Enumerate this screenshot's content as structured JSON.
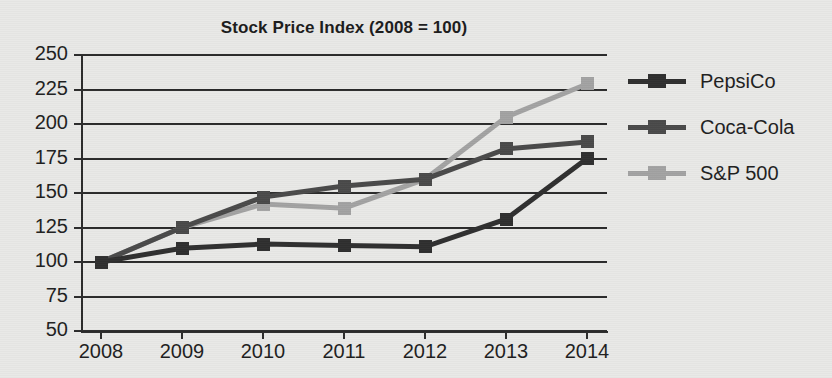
{
  "chart_data": {
    "type": "line",
    "title": "Stock Price Index (2008 = 100)",
    "xlabel": "",
    "ylabel": "",
    "categories": [
      "2008",
      "2009",
      "2010",
      "2011",
      "2012",
      "2013",
      "2014"
    ],
    "ylim": [
      50,
      250
    ],
    "ytick_step": 25,
    "yticks": [
      "250",
      "225",
      "200",
      "175",
      "150",
      "125",
      "100",
      "75",
      "50"
    ],
    "grid": "horizontal",
    "legend_position": "right",
    "series": [
      {
        "name": "PepsiCo",
        "color": "#2f2f2f",
        "values": [
          100,
          110,
          113,
          112,
          111,
          131,
          175
        ]
      },
      {
        "name": "Coca-Cola",
        "color": "#4a4a4a",
        "values": [
          100,
          125,
          147,
          155,
          160,
          182,
          187
        ]
      },
      {
        "name": "S&P 500",
        "color": "#a3a3a3",
        "values": [
          100,
          125,
          142,
          139,
          160,
          205,
          229
        ]
      }
    ]
  },
  "legend": {
    "items": [
      {
        "label": "PepsiCo"
      },
      {
        "label": "Coca-Cola"
      },
      {
        "label": "S&P 500"
      }
    ]
  },
  "colors": {
    "background": "#e9e9e7",
    "axis": "#2b2b2b",
    "text": "#1f1f1f",
    "pepsico": "#2f2f2f",
    "cocacola": "#4a4a4a",
    "sp500": "#a3a3a3"
  }
}
